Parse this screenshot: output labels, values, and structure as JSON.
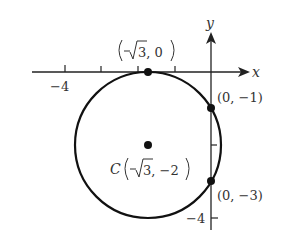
{
  "diagram": {
    "type": "coordinate-plane-circle",
    "axes": {
      "x_label": "x",
      "y_label": "y",
      "x_tick_label": "−4",
      "y_tick_label": "−4"
    },
    "circle": {
      "center_label_prefix": "C",
      "center_label_body": "3, −2",
      "center": [
        -1.732,
        -2
      ],
      "radius": 2
    },
    "points": [
      {
        "name": "top-point",
        "label": "3, 0",
        "coords": [
          -1.732,
          0
        ]
      },
      {
        "name": "y-intercept-upper",
        "label": "(0, −1)",
        "coords": [
          0,
          -1
        ]
      },
      {
        "name": "y-intercept-lower",
        "label": "(0, −3)",
        "coords": [
          0,
          -3
        ]
      }
    ],
    "colors": {
      "stroke": "#111111",
      "text": "#333333",
      "background": "#ffffff"
    }
  }
}
